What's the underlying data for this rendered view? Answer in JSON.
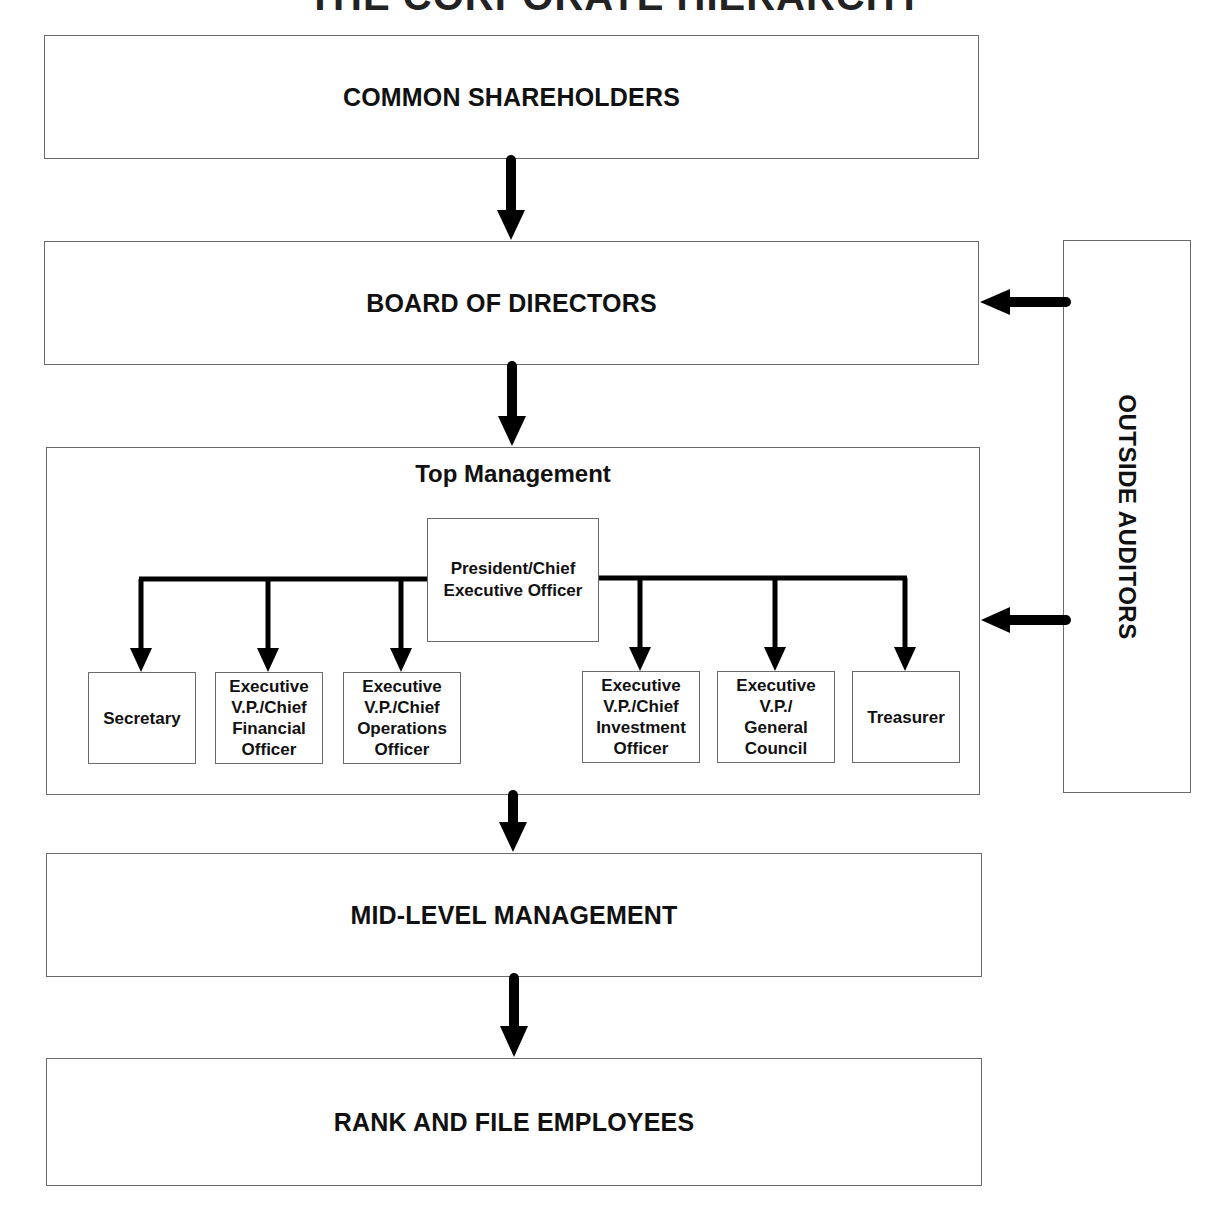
{
  "title": "THE CORPORATE HIERARCHY",
  "levels": {
    "shareholders": "COMMON SHAREHOLDERS",
    "board": "BOARD OF DIRECTORS",
    "top_management": "Top Management",
    "mid_management": "MID-LEVEL MANAGEMENT",
    "rank_and_file": "RANK AND FILE EMPLOYEES"
  },
  "outside_auditors": "OUTSIDE AUDITORS",
  "ceo": {
    "line1": "President/Chief",
    "line2": "Executive Officer"
  },
  "officers": [
    {
      "lines": [
        "Secretary"
      ]
    },
    {
      "lines": [
        "Executive",
        "V.P./Chief",
        "Financial",
        "Officer"
      ]
    },
    {
      "lines": [
        "Executive",
        "V.P./Chief",
        "Operations",
        "Officer"
      ]
    },
    {
      "lines": [
        "Executive",
        "V.P./Chief",
        "Investment",
        "Officer"
      ]
    },
    {
      "lines": [
        "Executive",
        "V.P./",
        "General",
        "Council"
      ]
    },
    {
      "lines": [
        "Treasurer"
      ]
    }
  ],
  "colors": {
    "box_border": "#6a6a6a",
    "arrow": "#000000",
    "text": "#111111"
  }
}
